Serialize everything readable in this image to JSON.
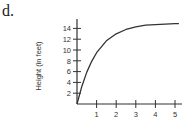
{
  "panel_label": "d.",
  "chart_data": {
    "type": "line",
    "title": "",
    "xlabel": "",
    "ylabel": "Height (in feet)",
    "x_ticks": [
      1,
      2,
      3,
      4,
      5
    ],
    "y_ticks": [
      2,
      4,
      6,
      8,
      10,
      12,
      14
    ],
    "xlim": [
      0,
      5.2
    ],
    "ylim": [
      0,
      16
    ],
    "grid": false,
    "legend": null,
    "series": [
      {
        "name": "height",
        "x": [
          0,
          0.25,
          0.5,
          0.75,
          1,
          1.5,
          2,
          2.5,
          3,
          3.5,
          4,
          4.5,
          5,
          5.2
        ],
        "values": [
          0,
          3.3,
          5.9,
          7.9,
          9.5,
          11.7,
          13.0,
          13.8,
          14.3,
          14.6,
          14.7,
          14.8,
          14.9,
          14.9
        ]
      }
    ]
  },
  "colors": {
    "axis": "#333333",
    "curve": "#333333"
  }
}
